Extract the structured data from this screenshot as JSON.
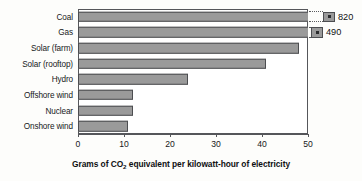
{
  "chart_data": {
    "type": "bar",
    "orientation": "horizontal",
    "title": "",
    "xlabel": "Grams of CO2 equivalent per kilowatt-hour of electricity",
    "xlabel_parts": {
      "before": "Grams of CO",
      "subscript": "2",
      "after": " equivalent per kilowatt-hour of electricity"
    },
    "ylabel": "",
    "xlim": [
      0,
      50
    ],
    "xticks": [
      0,
      10,
      20,
      30,
      40,
      50
    ],
    "xtick_labels": [
      "0",
      "10",
      "20",
      "30",
      "40",
      "50"
    ],
    "grid": false,
    "legend": false,
    "axis_break": true,
    "axis_break_note": "Coal and Gas bars exceed the 0-50 axis range and are truncated with a dotted break marker; their true values are shown as labels at the right edge.",
    "bar_color": "#9a9a9a",
    "bar_edge_color": "#4c4d50",
    "categories": [
      "Coal",
      "Gas",
      "Solar (farm)",
      "Solar (rooftop)",
      "Hydro",
      "Offshore wind",
      "Nuclear",
      "Onshore wind"
    ],
    "values": [
      820,
      490,
      48,
      41,
      24,
      12,
      12,
      11
    ],
    "bars": [
      {
        "label": "Coal",
        "value": 820,
        "value_label": "820",
        "truncated": true,
        "drawn_to": 50,
        "break_gap_px": 14,
        "stub": true
      },
      {
        "label": "Gas",
        "value": 490,
        "value_label": "490",
        "truncated": true,
        "drawn_to": 50,
        "break_gap_px": 2,
        "stub": true
      },
      {
        "label": "Solar (farm)",
        "value": 48,
        "value_label": "",
        "truncated": false,
        "drawn_to": 48,
        "break_gap_px": 0,
        "stub": false
      },
      {
        "label": "Solar (rooftop)",
        "value": 41,
        "value_label": "",
        "truncated": false,
        "drawn_to": 40.8,
        "break_gap_px": 0,
        "stub": false
      },
      {
        "label": "Hydro",
        "value": 24,
        "value_label": "",
        "truncated": false,
        "drawn_to": 24,
        "break_gap_px": 0,
        "stub": false
      },
      {
        "label": "Offshore wind",
        "value": 12,
        "value_label": "",
        "truncated": false,
        "drawn_to": 11.9,
        "break_gap_px": 0,
        "stub": false
      },
      {
        "label": "Nuclear",
        "value": 12,
        "value_label": "",
        "truncated": false,
        "drawn_to": 11.9,
        "break_gap_px": 0,
        "stub": false
      },
      {
        "label": "Onshore wind",
        "value": 11,
        "value_label": "",
        "truncated": false,
        "drawn_to": 10.9,
        "break_gap_px": 0,
        "stub": false
      }
    ]
  }
}
